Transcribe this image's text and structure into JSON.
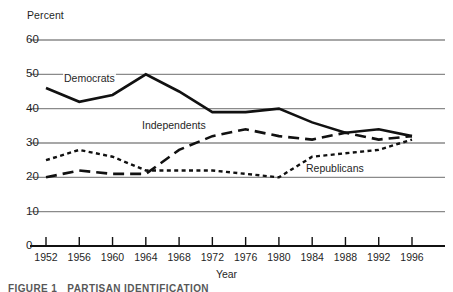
{
  "figure": {
    "caption_label": "FIGURE 1",
    "caption_title": "PARTISAN IDENTIFICATION"
  },
  "axes": {
    "y_axis_title": "Percent",
    "x_axis_title": "Year",
    "y_ticks": [
      "60",
      "50",
      "40",
      "30",
      "20",
      "10",
      "0"
    ],
    "x_ticks": [
      "1952",
      "1956",
      "1960",
      "1964",
      "1968",
      "1972",
      "1976",
      "1980",
      "1984",
      "1988",
      "1992",
      "1996"
    ]
  },
  "series_labels": {
    "democrats": "Democrats",
    "independents": "Independents",
    "republicans": "Republicans"
  },
  "colors": {
    "line": "#111111",
    "gridline": "#8a8a8a",
    "axis": "#111111",
    "text": "#1f1f1f",
    "background": "#ffffff"
  },
  "chart_data": {
    "type": "line",
    "title": "PARTISAN IDENTIFICATION",
    "xlabel": "Year",
    "ylabel": "Percent",
    "x": [
      1952,
      1956,
      1960,
      1964,
      1968,
      1972,
      1976,
      1980,
      1984,
      1988,
      1992,
      1996
    ],
    "categories": [
      "1952",
      "1956",
      "1960",
      "1964",
      "1968",
      "1972",
      "1976",
      "1980",
      "1984",
      "1988",
      "1992",
      "1996"
    ],
    "ylim": [
      0,
      60
    ],
    "xlim": [
      1952,
      1996
    ],
    "grid": true,
    "gridlines_y": [
      10,
      20,
      30,
      40,
      50,
      60
    ],
    "legend": "inline-labels",
    "series": [
      {
        "name": "Democrats",
        "style": "solid",
        "values": [
          46,
          42,
          44,
          50,
          45,
          39,
          39,
          40,
          36,
          33,
          34,
          32
        ]
      },
      {
        "name": "Independents",
        "style": "long-dash",
        "values": [
          20,
          22,
          21,
          21,
          28,
          32,
          34,
          32,
          31,
          33,
          31,
          32
        ]
      },
      {
        "name": "Republicans",
        "style": "dotted",
        "values": [
          25,
          28,
          26,
          22,
          22,
          22,
          21,
          20,
          26,
          27,
          28,
          31
        ]
      }
    ]
  }
}
